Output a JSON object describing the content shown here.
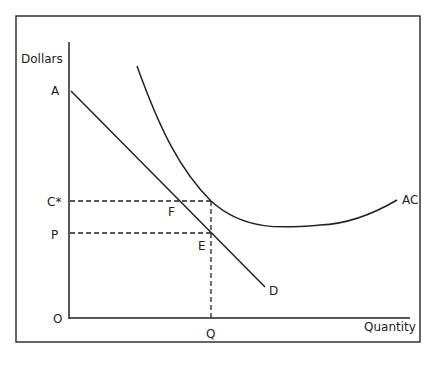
{
  "diagram": {
    "type": "economics-cost-demand",
    "axis_labels": {
      "y": "Dollars",
      "x": "Quantity",
      "origin": "O"
    },
    "curves": [
      {
        "name": "D",
        "label": "D",
        "kind": "demand (linear, downward sloping)"
      },
      {
        "name": "AC",
        "label": "AC",
        "kind": "average cost (U-shaped)"
      }
    ],
    "points": {
      "A": "A",
      "C_star": "C*",
      "P": "P",
      "F": "F",
      "E": "E",
      "Q": "Q"
    },
    "colors": {
      "line": "#222222",
      "background": "#ffffff"
    }
  }
}
